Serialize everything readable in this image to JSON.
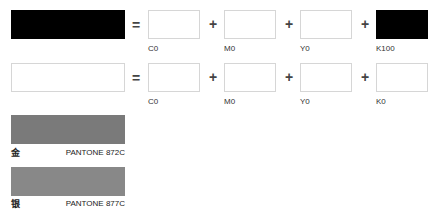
{
  "rows": [
    {
      "swatch_color": "#000000",
      "equals": "=",
      "components": [
        {
          "label": "C0",
          "color": "#ffffff",
          "op": "+"
        },
        {
          "label": "M0",
          "color": "#ffffff",
          "op": "+"
        },
        {
          "label": "Y0",
          "color": "#ffffff",
          "op": "+"
        },
        {
          "label": "K100",
          "color": "#000000"
        }
      ]
    },
    {
      "swatch_color": "#ffffff",
      "equals": "=",
      "components": [
        {
          "label": "C0",
          "color": "#ffffff",
          "op": "+"
        },
        {
          "label": "M0",
          "color": "#ffffff",
          "op": "+"
        },
        {
          "label": "Y0",
          "color": "#ffffff",
          "op": "+"
        },
        {
          "label": "K0",
          "color": "#ffffff"
        }
      ]
    }
  ],
  "pantone": [
    {
      "char": "金",
      "name": "PANTONE 872C",
      "color": "#7a7a7a"
    },
    {
      "char": "银",
      "name": "PANTONE 877C",
      "color": "#888888"
    }
  ]
}
